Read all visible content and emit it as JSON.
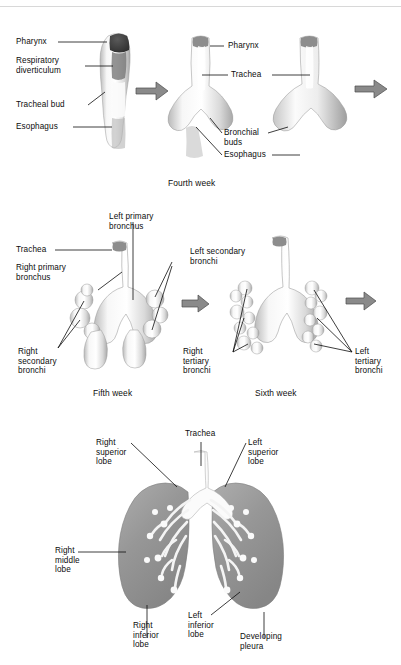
{
  "figure": {
    "background_color": "#ffffff",
    "label_color": "#0d0d0d",
    "arrow_color": "#8a8a8a",
    "arrow_outline_color": "#4a4a4a",
    "lung_fill_color": "#9a9a9a",
    "airway_fill_color": "#f2f2f2"
  },
  "panels": [
    {
      "id": "fourth-week",
      "caption": "Fourth week",
      "labels": [
        {
          "key": "pharynx_left",
          "text": "Pharynx"
        },
        {
          "key": "respiratory_diverticulum",
          "text": "Respiratory\ndiverticulum"
        },
        {
          "key": "tracheal_bud",
          "text": "Tracheal bud"
        },
        {
          "key": "esophagus_left",
          "text": "Esophagus"
        },
        {
          "key": "pharynx_mid",
          "text": "Pharynx"
        },
        {
          "key": "trachea_mid",
          "text": "Trachea"
        },
        {
          "key": "bronchial_buds",
          "text": "Bronchial\nbuds"
        },
        {
          "key": "esophagus_mid",
          "text": "Esophagus"
        }
      ]
    },
    {
      "id": "fifth-sixth-week",
      "caption_left": "Fifth week",
      "caption_right": "Sixth week",
      "labels": [
        {
          "key": "trachea",
          "text": "Trachea"
        },
        {
          "key": "right_primary_bronchus",
          "text": "Right primary\nbronchus"
        },
        {
          "key": "left_primary_bronchus",
          "text": "Left primary\nbronchus"
        },
        {
          "key": "left_secondary_bronchi",
          "text": "Left secondary\nbronchi"
        },
        {
          "key": "right_secondary_bronchi",
          "text": "Right\nsecondary\nbronchi"
        },
        {
          "key": "right_tertiary_bronchi",
          "text": "Right\ntertiary\nbronchi"
        },
        {
          "key": "left_tertiary_bronchi",
          "text": "Left\ntertiary\nbronchi"
        }
      ]
    },
    {
      "id": "mature-lungs",
      "labels": [
        {
          "key": "trachea",
          "text": "Trachea"
        },
        {
          "key": "right_superior_lobe",
          "text": "Right\nsuperior\nlobe"
        },
        {
          "key": "left_superior_lobe",
          "text": "Left\nsuperior\nlobe"
        },
        {
          "key": "right_middle_lobe",
          "text": "Right\nmiddle\nlobe"
        },
        {
          "key": "right_inferior_lobe",
          "text": "Right\ninferior\nlobe"
        },
        {
          "key": "left_inferior_lobe",
          "text": "Left\ninferior\nlobe"
        },
        {
          "key": "developing_pleura",
          "text": "Developing\npleura"
        }
      ]
    }
  ]
}
